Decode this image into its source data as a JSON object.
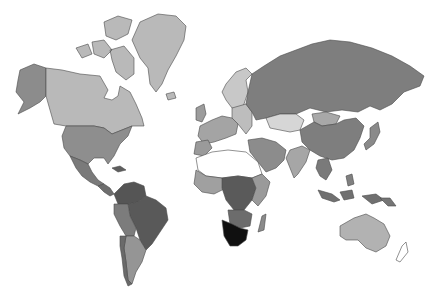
{
  "map": {
    "type": "choropleth",
    "projection": "miller",
    "background": "#ffffff",
    "border_color": "#4a4a4a",
    "regions": [
      {
        "id": "greenland",
        "fill": "#b9b9b9",
        "d": "M140,22 L158,14 L176,16 L186,26 L184,40 L176,56 L168,70 L162,84 L156,92 L150,84 L148,68 L140,58 L132,40 Z"
      },
      {
        "id": "canada-arctic",
        "fill": "#b9b9b9",
        "d": "M104,22 L118,16 L132,20 L128,34 L116,40 L106,36 Z M92,42 L104,40 L112,50 L104,58 L94,54 Z M110,50 L124,46 L134,58 L134,74 L126,80 L116,72 L112,60 Z M76,48 L88,44 L92,54 L82,58 Z"
      },
      {
        "id": "alaska",
        "fill": "#8c8c8c",
        "d": "M20,70 L34,64 L46,68 L46,96 L40,102 L30,108 L18,114 L24,102 L16,92 L18,80 Z"
      },
      {
        "id": "canada",
        "fill": "#b9b9b9",
        "d": "M46,68 L62,70 L80,74 L100,76 L108,90 L104,98 L112,100 L118,96 L120,86 L130,92 L136,104 L142,118 L144,126 L132,126 L122,130 L112,134 L104,128 L94,126 L66,126 L54,124 L50,110 L46,96 Z"
      },
      {
        "id": "usa",
        "fill": "#8e8e8e",
        "d": "M66,126 L94,126 L104,128 L112,134 L122,130 L132,126 L128,136 L120,144 L114,156 L108,164 L104,158 L94,158 L88,164 L80,160 L70,156 L64,148 L62,136 Z"
      },
      {
        "id": "mexico",
        "fill": "#7a7a7a",
        "d": "M70,156 L80,160 L88,164 L92,172 L98,180 L104,184 L98,186 L90,182 L82,176 L76,168 Z"
      },
      {
        "id": "central-america",
        "fill": "#6e6e6e",
        "d": "M98,186 L104,184 L110,188 L114,194 L110,196 L104,192 Z"
      },
      {
        "id": "caribbean",
        "fill": "#5e5e5e",
        "d": "M112,168 L120,166 L126,170 L118,172 Z"
      },
      {
        "id": "colombia-venezuela",
        "fill": "#555555",
        "d": "M114,194 L124,184 L134,182 L144,186 L146,196 L138,202 L128,204 L118,204 Z"
      },
      {
        "id": "brazil",
        "fill": "#595959",
        "d": "M128,204 L138,202 L146,196 L156,200 L166,208 L168,220 L160,232 L152,244 L146,250 L140,240 L136,228 L130,216 Z"
      },
      {
        "id": "peru-bolivia",
        "fill": "#7c7c7c",
        "d": "M114,204 L128,204 L130,216 L136,228 L134,236 L126,236 L120,226 L114,214 Z"
      },
      {
        "id": "argentina",
        "fill": "#959595",
        "d": "M126,236 L134,236 L140,240 L146,250 L142,262 L136,272 L132,284 L128,280 L126,262 L124,248 Z"
      },
      {
        "id": "chile",
        "fill": "#6a6a6a",
        "d": "M120,236 L126,236 L124,248 L126,262 L128,280 L132,284 L128,286 L124,276 L122,258 L120,246 Z"
      },
      {
        "id": "iceland",
        "fill": "#b9b9b9",
        "d": "M166,94 L174,92 L176,98 L168,100 Z"
      },
      {
        "id": "scandinavia",
        "fill": "#c8c8c8",
        "d": "M226,84 L236,72 L246,68 L252,74 L246,80 L248,92 L244,104 L238,112 L232,108 L226,100 L222,92 Z"
      },
      {
        "id": "uk",
        "fill": "#9c9c9c",
        "d": "M196,108 L204,104 L206,114 L202,122 L196,120 Z"
      },
      {
        "id": "western-europe",
        "fill": "#a4a4a4",
        "d": "M200,126 L212,120 L222,116 L232,118 L238,124 L236,134 L226,138 L214,142 L204,144 L198,136 Z"
      },
      {
        "id": "eastern-europe",
        "fill": "#bdbdbd",
        "d": "M232,108 L246,104 L252,112 L252,126 L246,134 L238,124 L232,118 Z"
      },
      {
        "id": "iberia",
        "fill": "#9a9a9a",
        "d": "M196,142 L208,140 L212,148 L204,156 L194,154 Z"
      },
      {
        "id": "russia",
        "fill": "#7e7e7e",
        "d": "M252,74 L264,66 L280,56 L296,50 L312,44 L330,40 L350,42 L372,48 L392,56 L410,66 L424,76 L420,86 L404,92 L392,104 L380,110 L370,106 L358,112 L342,110 L326,112 L310,108 L296,114 L280,114 L266,118 L256,120 L252,112 L246,104 L248,92 Z"
      },
      {
        "id": "kazakhstan",
        "fill": "#d6d6d6",
        "d": "M266,118 L280,114 L296,114 L304,120 L300,130 L290,132 L280,130 L270,128 Z"
      },
      {
        "id": "mongolia",
        "fill": "#a8a8a8",
        "d": "M312,114 L326,112 L340,116 L336,124 L322,126 L314,122 Z"
      },
      {
        "id": "china",
        "fill": "#7e7e7e",
        "d": "M300,130 L314,122 L322,126 L336,124 L344,120 L356,118 L364,126 L360,138 L354,150 L344,158 L332,160 L320,156 L310,150 L302,142 Z"
      },
      {
        "id": "japan",
        "fill": "#8a8a8a",
        "d": "M370,128 L378,122 L380,132 L374,144 L366,150 L364,144 L370,138 Z"
      },
      {
        "id": "middle-east",
        "fill": "#8c8c8c",
        "d": "M248,140 L262,138 L276,142 L286,150 L284,160 L276,168 L266,172 L258,162 L250,152 Z"
      },
      {
        "id": "india",
        "fill": "#a6a6a6",
        "d": "M290,150 L302,146 L310,150 L306,162 L298,174 L294,178 L290,168 L286,158 Z"
      },
      {
        "id": "se-asia",
        "fill": "#7a7a7a",
        "d": "M318,160 L328,158 L332,170 L326,180 L320,176 L316,168 Z"
      },
      {
        "id": "indonesia",
        "fill": "#707070",
        "d": "M318,190 L332,194 L340,200 L334,202 L322,198 Z M340,192 L352,190 L354,198 L344,200 Z M362,196 L376,194 L384,200 L372,204 Z"
      },
      {
        "id": "philippines",
        "fill": "#808080",
        "d": "M346,176 L352,174 L354,184 L348,186 Z"
      },
      {
        "id": "north-africa",
        "fill": "#ffffff",
        "d": "M196,158 L212,152 L228,150 L246,152 L258,162 L262,174 L252,178 L238,176 L222,178 L206,176 L198,170 Z"
      },
      {
        "id": "west-africa",
        "fill": "#a0a0a0",
        "d": "M196,170 L206,176 L222,178 L226,188 L214,194 L202,192 L194,184 Z"
      },
      {
        "id": "central-africa",
        "fill": "#5a5a5a",
        "d": "M222,178 L238,176 L252,178 L256,188 L252,200 L244,210 L234,210 L226,200 L222,188 Z"
      },
      {
        "id": "east-africa",
        "fill": "#9a9a9a",
        "d": "M252,178 L262,174 L270,182 L266,196 L258,206 L252,200 L256,188 Z"
      },
      {
        "id": "southern-africa-mid",
        "fill": "#6c6c6c",
        "d": "M228,210 L244,210 L252,214 L250,226 L240,228 L230,224 Z"
      },
      {
        "id": "south-africa-namibia",
        "fill": "#101010",
        "d": "M222,220 L232,224 L240,228 L248,230 L246,240 L238,246 L230,246 L224,236 Z"
      },
      {
        "id": "madagascar",
        "fill": "#8a8a8a",
        "d": "M262,216 L266,214 L264,230 L258,232 Z"
      },
      {
        "id": "australia",
        "fill": "#b2b2b2",
        "d": "M340,226 L354,218 L366,214 L374,218 L384,224 L390,236 L386,246 L376,252 L366,248 L358,240 L346,240 L340,236 Z"
      },
      {
        "id": "new-zealand",
        "fill": "#ffffff",
        "d": "M402,246 L406,242 L408,252 L400,262 L396,260 Z"
      },
      {
        "id": "png",
        "fill": "#757575",
        "d": "M380,198 L390,198 L396,206 L388,206 Z"
      }
    ]
  }
}
